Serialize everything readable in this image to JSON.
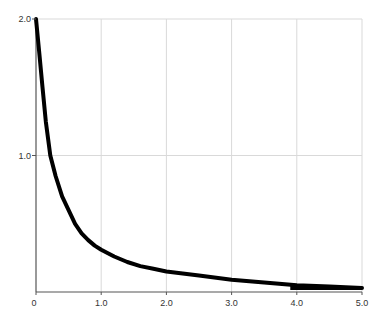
{
  "chart_data": {
    "type": "line",
    "title": "",
    "xlabel": "",
    "ylabel": "",
    "xlim": [
      0,
      5.0
    ],
    "ylim": [
      0,
      2.0
    ],
    "grid": true,
    "legend": null,
    "x_ticks": [
      {
        "value": 0,
        "label": "0"
      },
      {
        "value": 1.0,
        "label": "1.0"
      },
      {
        "value": 2.0,
        "label": "2.0"
      },
      {
        "value": 3.0,
        "label": "3.0"
      },
      {
        "value": 4.0,
        "label": "4.0"
      },
      {
        "value": 5.0,
        "label": "5.0"
      }
    ],
    "y_ticks": [
      {
        "value": 1.0,
        "label": "1.0"
      },
      {
        "value": 2.0,
        "label": "2.0"
      }
    ],
    "series": [
      {
        "name": "curve",
        "x": [
          0.0,
          0.05,
          0.1,
          0.15,
          0.22,
          0.3,
          0.4,
          0.5,
          0.6,
          0.7,
          0.8,
          0.9,
          1.0,
          1.2,
          1.4,
          1.6,
          1.8,
          2.0,
          2.5,
          3.0,
          3.5,
          4.0,
          4.5,
          5.0
        ],
        "values": [
          2.0,
          1.75,
          1.5,
          1.25,
          1.0,
          0.85,
          0.7,
          0.6,
          0.5,
          0.43,
          0.38,
          0.34,
          0.31,
          0.26,
          0.22,
          0.19,
          0.17,
          0.15,
          0.12,
          0.09,
          0.07,
          0.05,
          0.04,
          0.03
        ]
      }
    ],
    "shaded_region": {
      "x_start": 3.9,
      "x_end": 5.0,
      "color": "#000000"
    }
  },
  "colors": {
    "line": "#000000",
    "grid": "#d9d9d9",
    "axis": "#555555"
  }
}
